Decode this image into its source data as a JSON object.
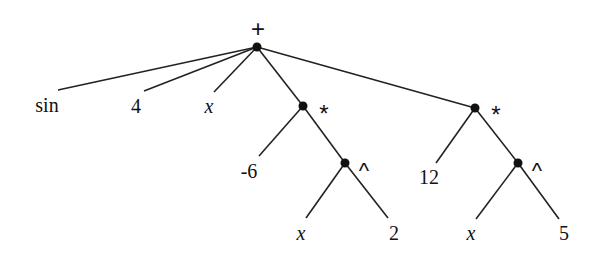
{
  "diagram": {
    "type": "expression-tree",
    "expression": "sin + 4 + x + (-6 * x^2) + (12 * x^5)",
    "root": {
      "label": "+",
      "children": [
        {
          "label": "sin"
        },
        {
          "label": "4"
        },
        {
          "label": "x"
        },
        {
          "label": "*",
          "children": [
            {
              "label": "-6"
            },
            {
              "label": "^",
              "children": [
                {
                  "label": "x"
                },
                {
                  "label": "2"
                }
              ]
            }
          ]
        },
        {
          "label": "*",
          "children": [
            {
              "label": "12"
            },
            {
              "label": "^",
              "children": [
                {
                  "label": "x"
                },
                {
                  "label": "5"
                }
              ]
            }
          ]
        }
      ]
    }
  },
  "labels": {
    "root_op": "+",
    "leaf_sin": "sin",
    "leaf_4": "4",
    "leaf_x1": "x",
    "mul_left_op": "*",
    "leaf_neg6": "-6",
    "pow_left_op": "^",
    "leaf_x2": "x",
    "leaf_2": "2",
    "mul_right_op": "*",
    "leaf_12": "12",
    "pow_right_op": "^",
    "leaf_x3": "x",
    "leaf_5": "5"
  }
}
